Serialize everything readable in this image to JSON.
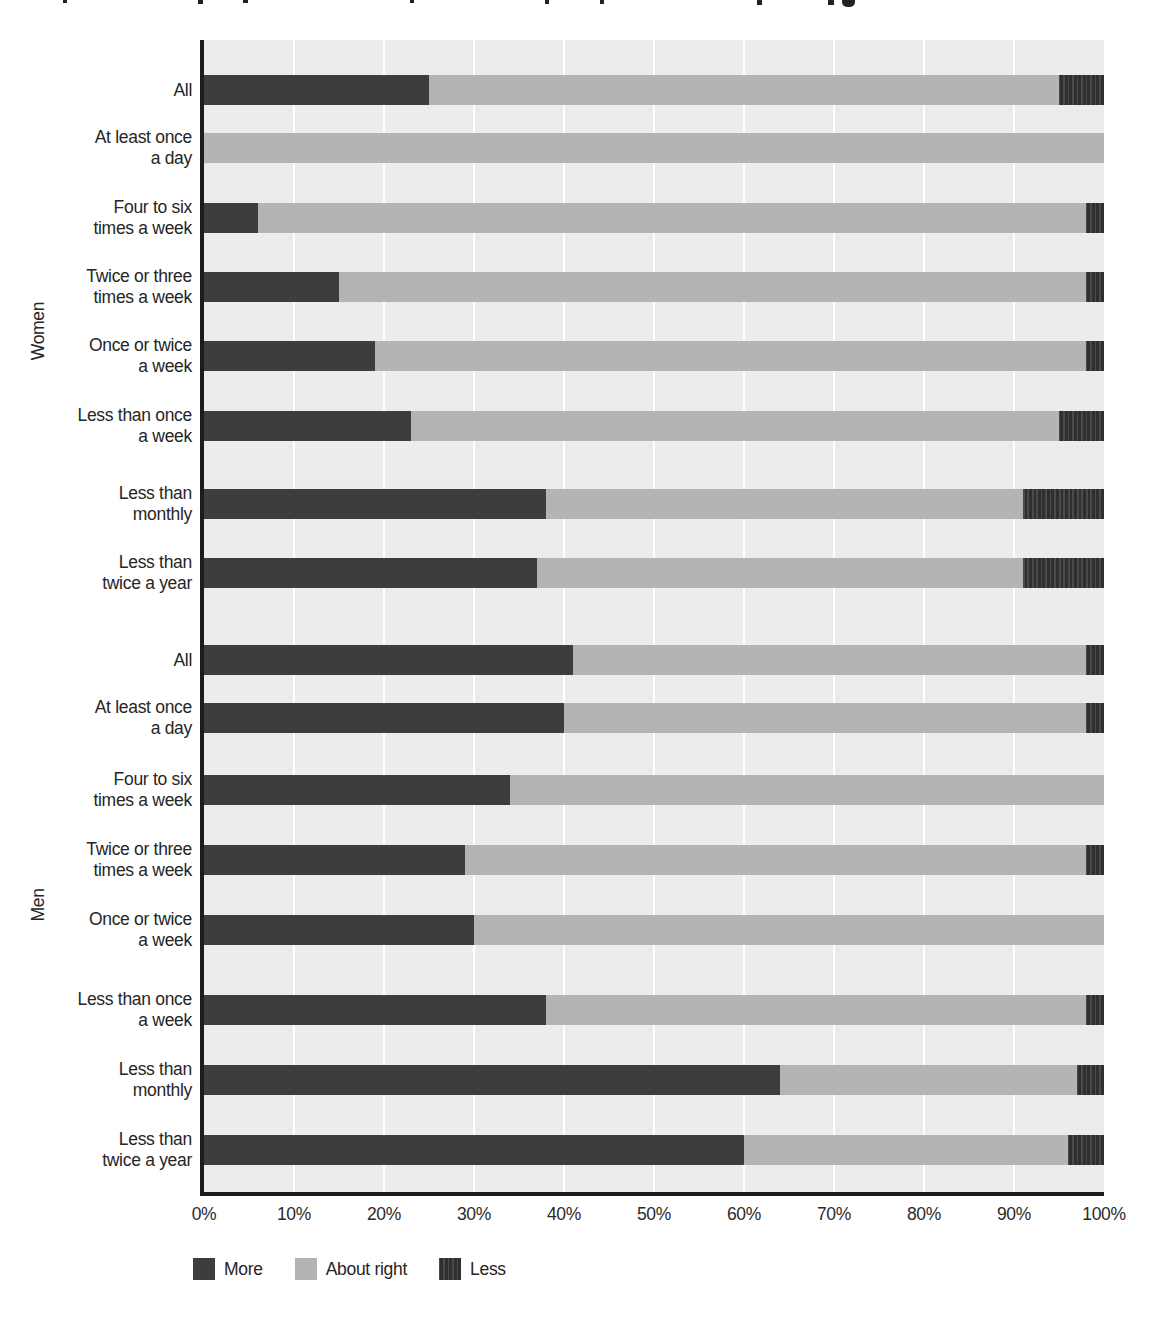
{
  "chart_data": {
    "type": "bar",
    "orientation": "horizontal",
    "stacked": true,
    "unit": "percent",
    "xlabel": "",
    "ylabel": "",
    "x_axis": {
      "min": 0,
      "max": 100,
      "tick_labels": [
        "0%",
        "10%",
        "20%",
        "30%",
        "40%",
        "50%",
        "60%",
        "70%",
        "80%",
        "90%",
        "100%"
      ],
      "gridlines": true
    },
    "legend": {
      "position": "bottom-left",
      "entries": [
        {
          "name": "More",
          "color": "#3d3d3d",
          "pattern": "solid"
        },
        {
          "name": "About right",
          "color": "#b4b4b4",
          "pattern": "solid"
        },
        {
          "name": "Less",
          "color": "#2f2f2f",
          "pattern": "vertical-stripes"
        }
      ]
    },
    "series_order": [
      "More",
      "About right",
      "Less"
    ],
    "groups": [
      {
        "label": "Women",
        "rows": [
          {
            "category": "All",
            "label_lines": [
              "All"
            ],
            "More": 25,
            "About right": 70,
            "Less": 5
          },
          {
            "category": "At least once a day",
            "label_lines": [
              "At least once",
              "a day"
            ],
            "More": 0,
            "About right": 100,
            "Less": 0
          },
          {
            "category": "Four to six times a week",
            "label_lines": [
              "Four to six",
              "times a week"
            ],
            "More": 6,
            "About right": 92,
            "Less": 2
          },
          {
            "category": "Twice or three times a week",
            "label_lines": [
              "Twice or three",
              "times a week"
            ],
            "More": 15,
            "About right": 83,
            "Less": 2
          },
          {
            "category": "Once or twice a week",
            "label_lines": [
              "Once or twice",
              "a week"
            ],
            "More": 19,
            "About right": 79,
            "Less": 2
          },
          {
            "category": "Less than once a week",
            "label_lines": [
              "Less than once",
              "a week"
            ],
            "More": 23,
            "About right": 72,
            "Less": 5
          },
          {
            "category": "Less than monthly",
            "label_lines": [
              "Less than",
              "monthly"
            ],
            "More": 38,
            "About right": 53,
            "Less": 9
          },
          {
            "category": "Less than twice a year",
            "label_lines": [
              "Less than",
              "twice a year"
            ],
            "More": 37,
            "About right": 54,
            "Less": 9
          }
        ]
      },
      {
        "label": "Men",
        "rows": [
          {
            "category": "All",
            "label_lines": [
              "All"
            ],
            "More": 41,
            "About right": 57,
            "Less": 2
          },
          {
            "category": "At least once a day",
            "label_lines": [
              "At least once",
              "a day"
            ],
            "More": 40,
            "About right": 58,
            "Less": 2
          },
          {
            "category": "Four to six times a week",
            "label_lines": [
              "Four to six",
              "times a week"
            ],
            "More": 34,
            "About right": 66,
            "Less": 0
          },
          {
            "category": "Twice or three times a week",
            "label_lines": [
              "Twice or three",
              "times a week"
            ],
            "More": 29,
            "About right": 69,
            "Less": 2
          },
          {
            "category": "Once or twice a week",
            "label_lines": [
              "Once or twice",
              "a week"
            ],
            "More": 30,
            "About right": 70,
            "Less": 0
          },
          {
            "category": "Less than once a week",
            "label_lines": [
              "Less than once",
              "a week"
            ],
            "More": 38,
            "About right": 60,
            "Less": 2
          },
          {
            "category": "Less than monthly",
            "label_lines": [
              "Less than",
              "monthly"
            ],
            "More": 64,
            "About right": 33,
            "Less": 3
          },
          {
            "category": "Less than twice a year",
            "label_lines": [
              "Less than",
              "twice a year"
            ],
            "More": 60,
            "About right": 36,
            "Less": 4
          }
        ]
      }
    ],
    "colors": {
      "plot_background": "#ececec",
      "gridline": "#ffffff",
      "axis": "#1c1c1c",
      "more": "#3d3d3d",
      "about_right": "#b4b4b4",
      "less": "#2f2f2f"
    }
  }
}
